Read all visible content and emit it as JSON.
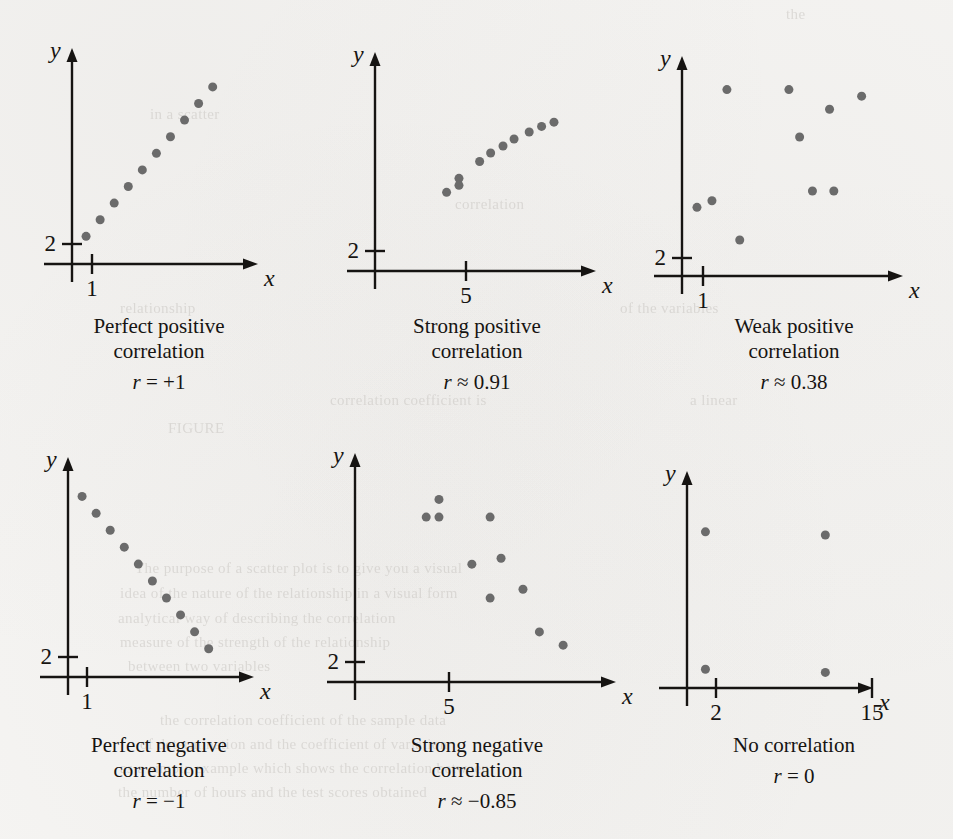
{
  "figure": {
    "background_color": "#f5f4f2",
    "ink_color": "#161412",
    "dot_color": "#6b6b6b",
    "dot_diameter_px": 9
  },
  "bleed_text": [
    {
      "text": "the",
      "x": 786,
      "y": 6
    },
    {
      "text": "in a scatter",
      "x": 150,
      "y": 106
    },
    {
      "text": "correlation",
      "x": 455,
      "y": 196
    },
    {
      "text": "relationship",
      "x": 120,
      "y": 300
    },
    {
      "text": "of the variables",
      "x": 620,
      "y": 300
    },
    {
      "text": "correlation coefficient is",
      "x": 330,
      "y": 392
    },
    {
      "text": "a linear",
      "x": 690,
      "y": 392
    },
    {
      "text": "FIGURE",
      "x": 168,
      "y": 420
    },
    {
      "text": "The purpose of a scatter plot is to give you a visual",
      "x": 135,
      "y": 560
    },
    {
      "text": "idea of the nature of the relationship in a visual form",
      "x": 120,
      "y": 585
    },
    {
      "text": "analytical way of describing the correlation",
      "x": 118,
      "y": 610
    },
    {
      "text": "measure of the strength of the relationship",
      "x": 120,
      "y": 634
    },
    {
      "text": "between two variables",
      "x": 128,
      "y": 658
    },
    {
      "text": "the correlation coefficient of the sample data",
      "x": 160,
      "y": 712
    },
    {
      "text": "of determination and the coefficient of variation",
      "x": 140,
      "y": 736
    },
    {
      "text": "as a simple example which shows the correlation between",
      "x": 120,
      "y": 760
    },
    {
      "text": "the number of hours and the test scores obtained",
      "x": 118,
      "y": 784
    }
  ],
  "panels": [
    {
      "id": "perfect-positive",
      "caption_line1": "Perfect positive",
      "caption_line2": "correlation",
      "r_label": "r",
      "r_value": "= +1",
      "r_full": "r = +1",
      "axes": {
        "x_label": "x",
        "y_label": "y",
        "y_tick_label": "2",
        "x_tick_label": "1"
      },
      "chart_data": {
        "type": "scatter",
        "title": "Perfect positive correlation",
        "xlabel": "x",
        "ylabel": "y",
        "annotations": [
          "r = +1"
        ],
        "x_ticks": [
          {
            "label": "1",
            "pos": 1
          }
        ],
        "y_ticks": [
          {
            "label": "2",
            "pos": 2
          }
        ],
        "grid": false,
        "legend": null,
        "points": [
          {
            "x": 1.0,
            "y": 2.0
          },
          {
            "x": 2.0,
            "y": 3.2
          },
          {
            "x": 3.0,
            "y": 4.4
          },
          {
            "x": 4.0,
            "y": 5.6
          },
          {
            "x": 5.0,
            "y": 6.8
          },
          {
            "x": 6.0,
            "y": 8.0
          },
          {
            "x": 7.0,
            "y": 9.2
          },
          {
            "x": 8.0,
            "y": 10.4
          },
          {
            "x": 9.0,
            "y": 11.6
          },
          {
            "x": 10.0,
            "y": 12.8
          }
        ]
      }
    },
    {
      "id": "strong-positive",
      "caption_line1": "Strong positive",
      "caption_line2": "correlation",
      "r_label": "r",
      "r_value": "≈ 0.91",
      "r_full": "r ≈ 0.91",
      "axes": {
        "x_label": "x",
        "y_label": "y",
        "y_tick_label": "2",
        "x_tick_label": "5"
      },
      "chart_data": {
        "type": "scatter",
        "title": "Strong positive correlation",
        "xlabel": "x",
        "ylabel": "y",
        "annotations": [
          "r ≈ 0.91"
        ],
        "x_ticks": [
          {
            "label": "5",
            "pos": 5
          }
        ],
        "y_ticks": [
          {
            "label": "2",
            "pos": 2
          }
        ],
        "grid": false,
        "legend": null,
        "points": [
          {
            "x": 5.2,
            "y": 5.6
          },
          {
            "x": 6.1,
            "y": 6.6
          },
          {
            "x": 6.1,
            "y": 6.1
          },
          {
            "x": 7.6,
            "y": 7.8
          },
          {
            "x": 8.4,
            "y": 8.4
          },
          {
            "x": 9.3,
            "y": 8.9
          },
          {
            "x": 10.1,
            "y": 9.4
          },
          {
            "x": 11.2,
            "y": 9.9
          },
          {
            "x": 12.1,
            "y": 10.3
          },
          {
            "x": 13.0,
            "y": 10.6
          }
        ]
      }
    },
    {
      "id": "weak-positive",
      "caption_line1": "Weak positive",
      "caption_line2": "correlation",
      "r_label": "r",
      "r_value": "≈ 0.38",
      "r_full": "r ≈ 0.38",
      "axes": {
        "x_label": "x",
        "y_label": "y",
        "y_tick_label": "2",
        "x_tick_label": "1"
      },
      "chart_data": {
        "type": "scatter",
        "title": "Weak positive correlation",
        "xlabel": "x",
        "ylabel": "y",
        "annotations": [
          "r ≈ 0.38"
        ],
        "x_ticks": [
          {
            "label": "1",
            "pos": 1
          }
        ],
        "y_ticks": [
          {
            "label": "2",
            "pos": 2
          }
        ],
        "grid": false,
        "legend": null,
        "points": [
          {
            "x": 0.7,
            "y": 4.2
          },
          {
            "x": 1.4,
            "y": 4.6
          },
          {
            "x": 2.1,
            "y": 11.4
          },
          {
            "x": 2.7,
            "y": 2.2
          },
          {
            "x": 5.0,
            "y": 11.4
          },
          {
            "x": 5.5,
            "y": 8.5
          },
          {
            "x": 6.1,
            "y": 5.2
          },
          {
            "x": 6.9,
            "y": 10.2
          },
          {
            "x": 7.1,
            "y": 5.2
          },
          {
            "x": 8.4,
            "y": 11.0
          }
        ]
      }
    },
    {
      "id": "perfect-negative",
      "caption_line1": "Perfect negative",
      "caption_line2": "correlation",
      "r_label": "r",
      "r_value": "= −1",
      "r_full": "r = −1",
      "axes": {
        "x_label": "x",
        "y_label": "y",
        "y_tick_label": "2",
        "x_tick_label": "1"
      },
      "chart_data": {
        "type": "scatter",
        "title": "Perfect negative correlation",
        "xlabel": "x",
        "ylabel": "y",
        "annotations": [
          "r = −1"
        ],
        "x_ticks": [
          {
            "label": "1",
            "pos": 1
          }
        ],
        "y_ticks": [
          {
            "label": "2",
            "pos": 2
          }
        ],
        "grid": false,
        "legend": null,
        "points": [
          {
            "x": 1.0,
            "y": 12.8
          },
          {
            "x": 2.0,
            "y": 11.6
          },
          {
            "x": 3.0,
            "y": 10.4
          },
          {
            "x": 4.0,
            "y": 9.2
          },
          {
            "x": 5.0,
            "y": 8.0
          },
          {
            "x": 6.0,
            "y": 6.8
          },
          {
            "x": 7.0,
            "y": 5.6
          },
          {
            "x": 8.0,
            "y": 4.4
          },
          {
            "x": 9.0,
            "y": 3.2
          },
          {
            "x": 10.0,
            "y": 2.0
          }
        ]
      }
    },
    {
      "id": "strong-negative",
      "caption_line1": "Strong negative",
      "caption_line2": "correlation",
      "r_label": "r",
      "r_value": "≈ −0.85",
      "r_full": "r ≈ −0.85",
      "axes": {
        "x_label": "x",
        "y_label": "y",
        "y_tick_label": "2",
        "x_tick_label": "5"
      },
      "chart_data": {
        "type": "scatter",
        "title": "Strong negative correlation",
        "xlabel": "x",
        "ylabel": "y",
        "annotations": [
          "r ≈ −0.85"
        ],
        "x_ticks": [
          {
            "label": "5",
            "pos": 5
          }
        ],
        "y_ticks": [
          {
            "label": "2",
            "pos": 2
          }
        ],
        "grid": false,
        "legend": null,
        "points": [
          {
            "x": 4.6,
            "y": 12.4
          },
          {
            "x": 3.9,
            "y": 11.2
          },
          {
            "x": 4.6,
            "y": 11.2
          },
          {
            "x": 7.4,
            "y": 11.2
          },
          {
            "x": 8.0,
            "y": 8.4
          },
          {
            "x": 6.4,
            "y": 8.0
          },
          {
            "x": 9.2,
            "y": 6.3
          },
          {
            "x": 7.4,
            "y": 5.7
          },
          {
            "x": 10.1,
            "y": 3.4
          },
          {
            "x": 11.4,
            "y": 2.5
          }
        ]
      }
    },
    {
      "id": "no-correlation",
      "caption_line1": "No correlation",
      "caption_line2": "",
      "r_label": "r",
      "r_value": "= 0",
      "r_full": "r = 0",
      "axes": {
        "x_label": "x",
        "y_label": "y",
        "y_tick_label": "",
        "x_tick_label_1": "2",
        "x_tick_label_2": "15"
      },
      "chart_data": {
        "type": "scatter",
        "title": "No correlation",
        "xlabel": "x",
        "ylabel": "y",
        "annotations": [
          "r = 0"
        ],
        "x_ticks": [
          {
            "label": "2",
            "pos": 2
          },
          {
            "label": "15",
            "pos": 15
          }
        ],
        "y_ticks": [],
        "grid": false,
        "legend": null,
        "points": [
          {
            "x": 2,
            "y": 10.0
          },
          {
            "x": 15,
            "y": 9.8
          },
          {
            "x": 2,
            "y": 1.2
          },
          {
            "x": 15,
            "y": 1.0
          }
        ]
      }
    }
  ]
}
